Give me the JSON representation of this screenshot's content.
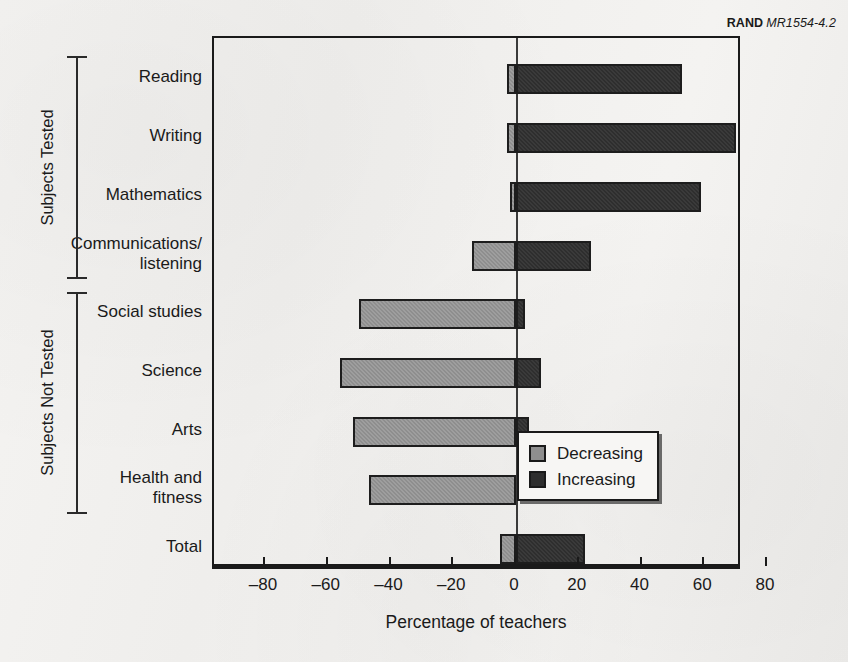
{
  "credit": {
    "brand": "RAND",
    "id": "MR1554-4.2"
  },
  "axis": {
    "x_title": "Percentage of teachers",
    "x_ticks": [
      "–80",
      "–60",
      "–40",
      "–20",
      "0",
      "20",
      "40",
      "60",
      "80"
    ]
  },
  "groups": [
    {
      "title": "Subjects Tested"
    },
    {
      "title": "Subjects Not Tested"
    }
  ],
  "legend": {
    "items": [
      {
        "label": "Decreasing",
        "color": "#8e8e8e"
      },
      {
        "label": "Increasing",
        "color": "#2e2e2e"
      }
    ]
  },
  "chart_data": {
    "type": "bar",
    "orientation": "horizontal",
    "stacked": true,
    "title": "",
    "xlabel": "Percentage of teachers",
    "ylabel": "",
    "xlim": [
      -80,
      80
    ],
    "xticks": [
      -80,
      -60,
      -40,
      -20,
      0,
      20,
      40,
      60,
      80
    ],
    "grid": false,
    "legend_position": "inside-right",
    "categories": [
      "Reading",
      "Writing",
      "Mathematics",
      "Communications/\nlistening",
      "Social studies",
      "Science",
      "Arts",
      "Health and\nfitness",
      "Total"
    ],
    "series": [
      {
        "name": "Decreasing",
        "color": "#8e8e8e",
        "values": [
          -3,
          -3,
          -2,
          -14,
          -50,
          -56,
          -52,
          -47,
          -5
        ]
      },
      {
        "name": "Increasing",
        "color": "#2e2e2e",
        "values": [
          53,
          70,
          59,
          24,
          3,
          8,
          4,
          0,
          22
        ]
      }
    ],
    "group_labels": {
      "Subjects Tested": [
        "Reading",
        "Writing",
        "Mathematics",
        "Communications/listening"
      ],
      "Subjects Not Tested": [
        "Social studies",
        "Science",
        "Arts",
        "Health and fitness"
      ]
    }
  }
}
